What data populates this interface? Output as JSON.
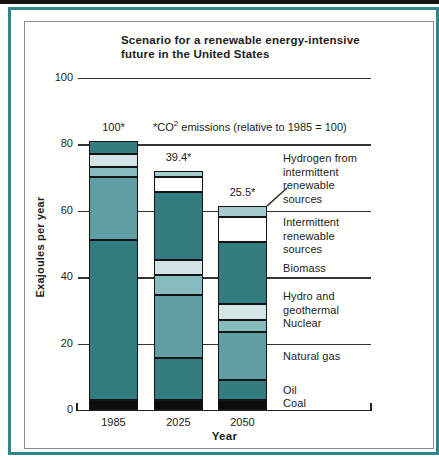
{
  "page": {
    "top_strip_color": "#151310",
    "frame_color": "#2f8588",
    "box_border_color": "#8a8a8a"
  },
  "chart_data": {
    "type": "bar",
    "stacked": true,
    "title": "Scenario for a renewable energy-intensive\nfuture in the United States",
    "xlabel": "Year",
    "ylabel": "Exajoules per year",
    "ylim": [
      0,
      100
    ],
    "yticks": [
      0,
      20,
      40,
      60,
      80,
      100
    ],
    "grid": "horizontal",
    "legend_position": "right",
    "categories": [
      "1985",
      "2025",
      "2050"
    ],
    "series": [
      {
        "name": "Coal",
        "color": "#0d0d0d",
        "values": [
          3,
          3,
          3
        ]
      },
      {
        "name": "Oil",
        "color": "#337c80",
        "values": [
          48,
          12.5,
          6
        ]
      },
      {
        "name": "Natural gas",
        "color": "#5f9fa3",
        "values": [
          19,
          19,
          14.5
        ]
      },
      {
        "name": "Nuclear",
        "color": "#87bcbf",
        "values": [
          3,
          6,
          3.5
        ]
      },
      {
        "name": "Hydro and geothermal",
        "color": "#d2e4e5",
        "values": [
          4,
          4.5,
          5
        ]
      },
      {
        "name": "Biomass",
        "color": "#337c80",
        "values": [
          4,
          20.5,
          18.5
        ]
      },
      {
        "name": "Intermittent renewable sources",
        "color": "#ffffff",
        "values": [
          0,
          4.5,
          7.5
        ]
      },
      {
        "name": "Hydrogen from intermittent renewable sources",
        "color": "#a5cdcf",
        "values": [
          0,
          2,
          3.5
        ]
      }
    ],
    "bar_totals": [
      81,
      72,
      61.5
    ],
    "bar_annotations": [
      "100*",
      "39.4*",
      "25.5*"
    ],
    "annotation_note": {
      "prefix": "*CO",
      "sup": "2",
      "suffix": " emissions (relative to 1985 = 100)"
    },
    "right_labels": [
      {
        "name": "hydrogen",
        "text": "Hydrogen from\nintermittent\nrenewable\nsources"
      },
      {
        "name": "intermittent",
        "text": "Intermittent\nrenewable\nsources"
      },
      {
        "name": "biomass",
        "text": "Biomass"
      },
      {
        "name": "hydro-geothermal",
        "text": "Hydro and\ngeothermal"
      },
      {
        "name": "nuclear",
        "text": "Nuclear"
      },
      {
        "name": "natural-gas",
        "text": "Natural gas"
      },
      {
        "name": "oil",
        "text": "Oil"
      },
      {
        "name": "coal",
        "text": "Coal"
      }
    ]
  }
}
